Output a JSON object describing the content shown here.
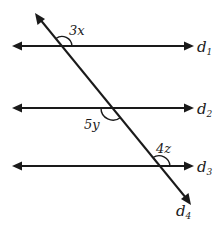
{
  "diagram": {
    "type": "parallel lines cut by a transversal",
    "lines": [
      {
        "id": "d1",
        "label": "d",
        "subscript": "1",
        "y": 46
      },
      {
        "id": "d2",
        "label": "d",
        "subscript": "2",
        "y": 108
      },
      {
        "id": "d3",
        "label": "d",
        "subscript": "3",
        "y": 166
      },
      {
        "id": "d4",
        "label": "d",
        "subscript": "4",
        "role": "transversal"
      }
    ],
    "angles": [
      {
        "label": "3x",
        "at": "d1 ∩ d4",
        "position": "upper-right"
      },
      {
        "label": "5y",
        "at": "d2 ∩ d4",
        "position": "lower-left"
      },
      {
        "label": "4z",
        "at": "d3 ∩ d4",
        "position": "upper-right"
      }
    ],
    "colors": {
      "stroke": "#1a1a1a",
      "background": "#ffffff"
    }
  }
}
